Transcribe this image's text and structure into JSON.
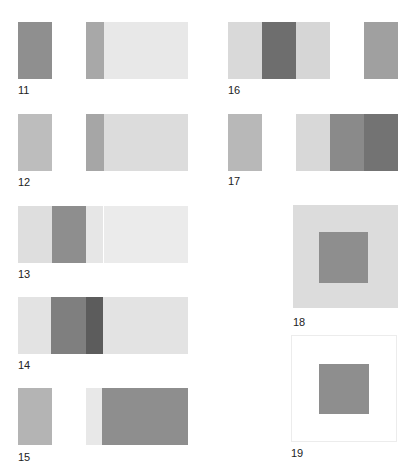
{
  "strip_panels": [
    {
      "id": "11",
      "label": "11",
      "x": 18,
      "y": 22,
      "w": 170,
      "h": 57,
      "stripes": [
        {
          "w": 34,
          "color": "#8f8f8f"
        },
        {
          "w": 34,
          "color": "#ffffff"
        },
        {
          "w": 18,
          "color": "#a8a8a8"
        },
        {
          "w": 84,
          "color": "#e8e8e8"
        }
      ]
    },
    {
      "id": "12",
      "label": "12",
      "x": 18,
      "y": 114,
      "w": 170,
      "h": 57,
      "stripes": [
        {
          "w": 34,
          "color": "#bdbdbd"
        },
        {
          "w": 34,
          "color": "#ffffff"
        },
        {
          "w": 18,
          "color": "#a6a6a6"
        },
        {
          "w": 84,
          "color": "#dcdcdc"
        }
      ]
    },
    {
      "id": "13",
      "label": "13",
      "x": 18,
      "y": 206,
      "w": 170,
      "h": 57,
      "stripes": [
        {
          "w": 34,
          "color": "#dedede"
        },
        {
          "w": 34,
          "color": "#8e8e8e"
        },
        {
          "w": 17,
          "color": "#e6e6e6"
        },
        {
          "w": 1,
          "color": "#ffffff"
        },
        {
          "w": 84,
          "color": "#ebebeb"
        }
      ]
    },
    {
      "id": "14",
      "label": "14",
      "x": 18,
      "y": 297,
      "w": 170,
      "h": 57,
      "stripes": [
        {
          "w": 33,
          "color": "#e3e3e3"
        },
        {
          "w": 35,
          "color": "#7f7f7f"
        },
        {
          "w": 17,
          "color": "#5c5c5c"
        },
        {
          "w": 85,
          "color": "#e3e3e3"
        }
      ]
    },
    {
      "id": "15",
      "label": "15",
      "x": 18,
      "y": 388,
      "w": 170,
      "h": 57,
      "stripes": [
        {
          "w": 34,
          "color": "#b4b4b4"
        },
        {
          "w": 34,
          "color": "#ffffff"
        },
        {
          "w": 16,
          "color": "#e8e8e8"
        },
        {
          "w": 86,
          "color": "#8e8e8e"
        }
      ]
    },
    {
      "id": "16",
      "label": "16",
      "x": 228,
      "y": 22,
      "w": 170,
      "h": 57,
      "stripes": [
        {
          "w": 34,
          "color": "#d9d9d9"
        },
        {
          "w": 34,
          "color": "#6e6e6e"
        },
        {
          "w": 34,
          "color": "#d6d6d6"
        },
        {
          "w": 34,
          "color": "#ffffff"
        },
        {
          "w": 34,
          "color": "#a0a0a0"
        }
      ]
    },
    {
      "id": "17",
      "label": "17",
      "x": 228,
      "y": 114,
      "w": 170,
      "h": 57,
      "stripes": [
        {
          "w": 34,
          "color": "#b8b8b8"
        },
        {
          "w": 34,
          "color": "#ffffff"
        },
        {
          "w": 34,
          "color": "#d8d8d8"
        },
        {
          "w": 34,
          "color": "#8a8a8a"
        },
        {
          "w": 34,
          "color": "#737373"
        }
      ]
    }
  ],
  "square_panels": [
    {
      "id": "18",
      "label": "18",
      "outer": {
        "x": 293,
        "y": 205,
        "w": 105,
        "h": 103,
        "color": "#dcdcdc",
        "border": "none"
      },
      "inner": {
        "x": 319,
        "y": 232,
        "w": 49,
        "h": 51,
        "color": "#8e8e8e"
      }
    },
    {
      "id": "19",
      "label": "19",
      "outer": {
        "x": 291,
        "y": 335,
        "w": 106,
        "h": 107,
        "color": "#ffffff",
        "border": "1px solid #ececec"
      },
      "inner": {
        "x": 319,
        "y": 364,
        "w": 50,
        "h": 50,
        "color": "#8e8e8e"
      }
    }
  ],
  "labels": {
    "11": {
      "text": "11",
      "x": 18,
      "y": 84
    },
    "12": {
      "text": "12",
      "x": 18,
      "y": 176
    },
    "13": {
      "text": "13",
      "x": 18,
      "y": 268
    },
    "14": {
      "text": "14",
      "x": 18,
      "y": 359
    },
    "15": {
      "text": "15",
      "x": 18,
      "y": 451
    },
    "16": {
      "text": "16",
      "x": 228,
      "y": 84
    },
    "17": {
      "text": "17",
      "x": 228,
      "y": 175
    },
    "18": {
      "text": "18",
      "x": 293,
      "y": 316
    },
    "19": {
      "text": "19",
      "x": 291,
      "y": 447
    }
  }
}
